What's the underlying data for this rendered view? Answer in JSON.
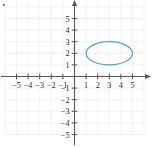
{
  "figure": {
    "title": "",
    "corner_mark": "dot"
  },
  "chart_data": {
    "type": "scatter",
    "title": "",
    "xlabel": "",
    "ylabel": "",
    "xlim": [
      -6.2,
      6.6
    ],
    "ylim": [
      -5.9,
      7.2
    ],
    "grid": true,
    "grid_color": "#efeff1",
    "axis_color": "#58585a",
    "axis_arrows": [
      "x-positive",
      "y-positive"
    ],
    "tick_step": 1,
    "xticks": [
      -5,
      -4,
      -3,
      -2,
      -1,
      1,
      2,
      3,
      4,
      5
    ],
    "xticklabels": [
      "−5",
      "−4",
      "−3",
      "−2",
      "−1",
      "1",
      "2",
      "3",
      "4",
      "5"
    ],
    "yticks": [
      -5,
      -4,
      -3,
      -2,
      -1,
      1,
      2,
      3,
      4,
      5,
      7
    ],
    "yticklabels": [
      "−5",
      "−4",
      "−3",
      "−2",
      "−1",
      "1",
      "2",
      "3",
      "4",
      "5",
      "7"
    ],
    "series": [
      {
        "name": "ellipse",
        "type": "ellipse",
        "center": [
          3,
          2
        ],
        "semi_axis_x": 2,
        "semi_axis_y": 1,
        "x_range": [
          1,
          5
        ],
        "y_range": [
          1,
          3
        ],
        "color": "#4aa8c8",
        "fill": "none",
        "linewidth": 1.2
      }
    ]
  },
  "axis_labels": {
    "x_negative": [
      "−5",
      "−4",
      "−3",
      "−2",
      "−1"
    ],
    "x_positive": [
      "1",
      "2",
      "3",
      "4",
      "5"
    ],
    "y_positive": [
      "1",
      "2",
      "3",
      "4",
      "5",
      "7"
    ],
    "y_negative": [
      "−1",
      "−2",
      "−3",
      "−4",
      "−5"
    ]
  }
}
